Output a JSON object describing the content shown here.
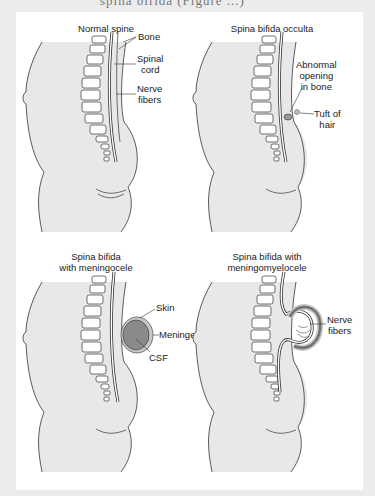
{
  "caption_clipped": "spina bifida (Figure ...)",
  "figures": [
    {
      "id": "normal",
      "title": "Normal spine",
      "labels": [
        "Bone",
        "Spinal\ncord",
        "Nerve\nfibers"
      ]
    },
    {
      "id": "occulta",
      "title": "Spina bifida occulta",
      "labels": [
        "Abnormal\nopening\nin bone",
        "Tuft of\nhair"
      ]
    },
    {
      "id": "meningocele",
      "title": "Spina bifida\nwith meningocele",
      "labels": [
        "Skin",
        "Meninges",
        "CSF"
      ]
    },
    {
      "id": "meningomyelocele",
      "title": "Spina bifida with\nmeningomyelocele",
      "labels": [
        "Nerve\nfibers"
      ]
    }
  ],
  "colors": {
    "background": "#ececec",
    "panel": "#ffffff",
    "body_shade": "#e8e8e8",
    "line": "#333333",
    "sac_fill": "#8a8a8a",
    "sac_ring": "#c8c8c8"
  }
}
